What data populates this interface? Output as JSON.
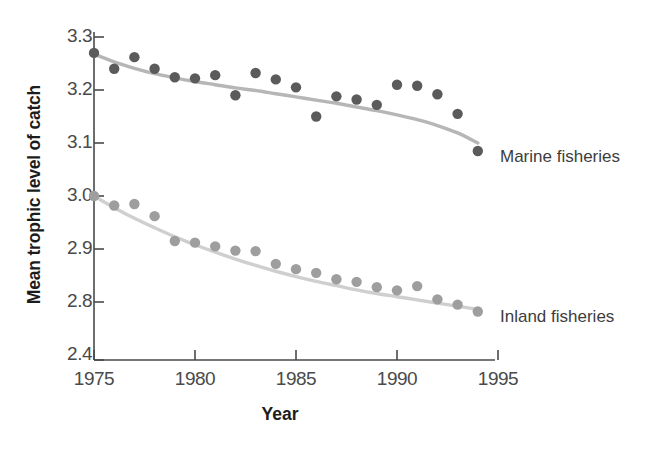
{
  "chart_data": {
    "type": "line",
    "title": "",
    "xlabel": "Year",
    "ylabel": "Mean trophic level of catch",
    "xlim": [
      1975,
      1995
    ],
    "ylim": [
      2.4,
      3.3
    ],
    "grid": false,
    "legend_position": "right-inline",
    "x_ticks": [
      "1975",
      "1980",
      "1985",
      "1990",
      "1995"
    ],
    "x_tick_values": [
      1975,
      1980,
      1985,
      1990,
      1995
    ],
    "y_ticks": [
      "3.3",
      "3.2",
      "3.1",
      "3.0",
      "2.9",
      "2.8",
      "2.4"
    ],
    "y_tick_values": [
      3.3,
      3.2,
      3.1,
      3.0,
      2.9,
      2.8,
      2.4
    ],
    "axis_break_note": "y-axis broken between 2.8 and 2.4",
    "x": [
      1975,
      1976,
      1977,
      1978,
      1979,
      1980,
      1981,
      1982,
      1983,
      1984,
      1985,
      1986,
      1987,
      1988,
      1989,
      1990,
      1991,
      1992,
      1993,
      1994
    ],
    "series": [
      {
        "name": "Marine fisheries",
        "color": "#5b5b5b",
        "trend_color": "#b6b6b6",
        "values": [
          3.27,
          3.24,
          3.262,
          3.24,
          3.224,
          3.222,
          3.228,
          3.19,
          3.232,
          3.22,
          3.205,
          3.15,
          3.188,
          3.182,
          3.172,
          3.21,
          3.208,
          3.192,
          3.155,
          3.085
        ],
        "trend": [
          3.268,
          3.253,
          3.241,
          3.231,
          3.223,
          3.216,
          3.21,
          3.204,
          3.199,
          3.193,
          3.187,
          3.181,
          3.175,
          3.168,
          3.161,
          3.153,
          3.144,
          3.133,
          3.119,
          3.1
        ]
      },
      {
        "name": "Inland fisheries",
        "color": "#9e9e9e",
        "trend_color": "#cfcfcf",
        "values": [
          3.0,
          2.982,
          2.985,
          2.962,
          2.915,
          2.912,
          2.905,
          2.897,
          2.896,
          2.872,
          2.862,
          2.855,
          2.843,
          2.838,
          2.828,
          2.822,
          2.83,
          2.805,
          2.795,
          2.782
        ],
        "trend": [
          3.0,
          2.978,
          2.958,
          2.94,
          2.923,
          2.908,
          2.894,
          2.881,
          2.869,
          2.858,
          2.848,
          2.839,
          2.831,
          2.823,
          2.816,
          2.81,
          2.804,
          2.798,
          2.792,
          2.786
        ]
      }
    ]
  },
  "labels": {
    "marine": "Marine fisheries",
    "inland": "Inland fisheries"
  }
}
